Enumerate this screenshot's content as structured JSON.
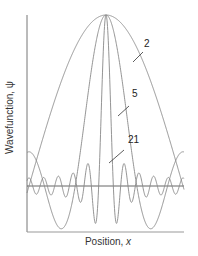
{
  "figure": {
    "y_axis_label": "Wavefunction, ψ",
    "x_axis_label_prefix": "Position, ",
    "x_axis_label_var": "x"
  },
  "curves": [
    {
      "label": "2",
      "n_waves": 2,
      "label_pos": [
        144,
        44
      ],
      "leader": [
        [
          133,
          62
        ],
        [
          143,
          52
        ]
      ]
    },
    {
      "label": "5",
      "n_waves": 5,
      "label_pos": [
        132,
        94
      ],
      "leader": [
        [
          118,
          116
        ],
        [
          129,
          106
        ]
      ]
    },
    {
      "label": "21",
      "n_waves": 21,
      "label_pos": [
        128,
        140
      ],
      "leader": [
        [
          109,
          163
        ],
        [
          124,
          150
        ]
      ]
    }
  ],
  "chart_data": {
    "type": "line",
    "title": "",
    "xlabel": "Position, x",
    "ylabel": "Wavefunction, ψ",
    "series": [
      {
        "name": "2",
        "description": "superposition of 2 waves; broad peak at center, zeros near plot edges"
      },
      {
        "name": "5",
        "description": "superposition of 5 waves; narrower peak with side lobes"
      },
      {
        "name": "21",
        "description": "superposition of 21 waves; very narrow central spike with small ripples"
      }
    ],
    "grid": false,
    "legend": "inline labels 2, 5, 21 with leader lines",
    "peak_value_normalized": 1,
    "zero_baseline": true
  },
  "colors": {
    "axis": "#777777",
    "curve": "#888888",
    "zero_line": "#555555",
    "text": "#222222"
  }
}
